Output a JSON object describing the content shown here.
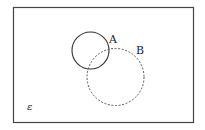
{
  "diagram": {
    "type": "venn",
    "universe_label": "ε",
    "sets": [
      {
        "name": "A",
        "label": "A",
        "style": "solid"
      },
      {
        "name": "B",
        "label": "B",
        "style": "dashed"
      }
    ]
  },
  "colors": {
    "stroke": "#333333",
    "background": "#ffffff"
  }
}
